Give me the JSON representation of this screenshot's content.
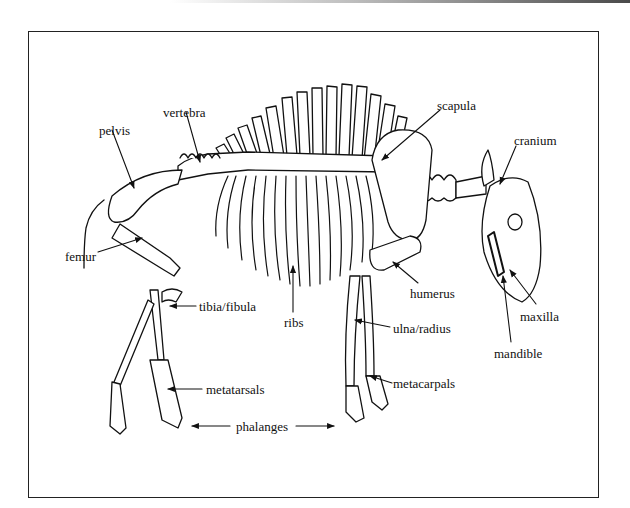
{
  "diagram": {
    "labels": [
      {
        "id": "pelvis",
        "text": "pelvis",
        "x": 99,
        "y": 124
      },
      {
        "id": "vertebra",
        "text": "vertebra",
        "x": 163,
        "y": 106
      },
      {
        "id": "scapula",
        "text": "scapula",
        "x": 437,
        "y": 99
      },
      {
        "id": "cranium",
        "text": "cranium",
        "x": 514,
        "y": 134
      },
      {
        "id": "femur",
        "text": "femur",
        "x": 65,
        "y": 257
      },
      {
        "id": "ribs",
        "text": "ribs",
        "x": 284,
        "y": 322
      },
      {
        "id": "humerus",
        "text": "humerus",
        "x": 410,
        "y": 287
      },
      {
        "id": "tibia-fibula",
        "text": "tibia/fibula",
        "x": 199,
        "y": 306
      },
      {
        "id": "maxilla",
        "text": "maxilla",
        "x": 520,
        "y": 310
      },
      {
        "id": "ulna-radius",
        "text": "ulna/radius",
        "x": 393,
        "y": 322
      },
      {
        "id": "mandible",
        "text": "mandible",
        "x": 494,
        "y": 347
      },
      {
        "id": "metatarsals",
        "text": "metatarsals",
        "x": 210,
        "y": 383
      },
      {
        "id": "metacarpals",
        "text": "metacarpals",
        "x": 393,
        "y": 377
      },
      {
        "id": "phalanges",
        "text": "phalanges",
        "x": 237,
        "y": 420
      }
    ]
  }
}
